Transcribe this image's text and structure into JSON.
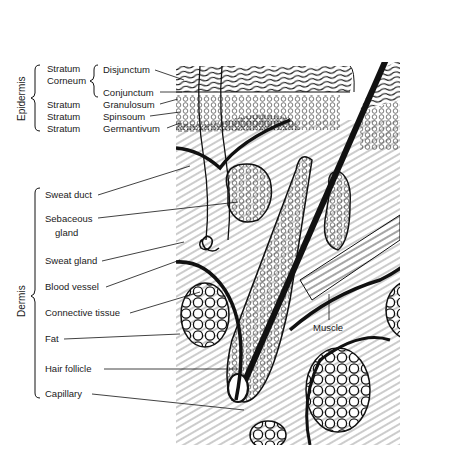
{
  "diagram": {
    "groups": [
      {
        "label": "Epidermis"
      },
      {
        "label": "Dermis"
      }
    ],
    "epidermis_labels": {
      "stratum_corneum_1": "Stratum",
      "stratum_corneum_2": "Corneum",
      "disjunctum": "Disjunctum",
      "conjunctum": "Conjunctum",
      "stratum_a": "Stratum",
      "granulosum": "Granulosum",
      "stratum_b": "Stratum",
      "spinsoum": "Spinsoum",
      "stratum_c": "Stratum",
      "germantivum": "Germantivum"
    },
    "dermis_labels": [
      {
        "label": "Sweat duct"
      },
      {
        "label": "Sebaceous"
      },
      {
        "label": "gland"
      },
      {
        "label": "Sweat gland"
      },
      {
        "label": "Blood vessel"
      },
      {
        "label": "Connective tissue"
      },
      {
        "label": "Fat"
      },
      {
        "label": "Hair follicle"
      },
      {
        "label": "Capillary"
      }
    ],
    "other_labels": {
      "muscle": "Muscle"
    },
    "colors": {
      "ink": "#1a1a1a",
      "background": "#ffffff"
    }
  }
}
